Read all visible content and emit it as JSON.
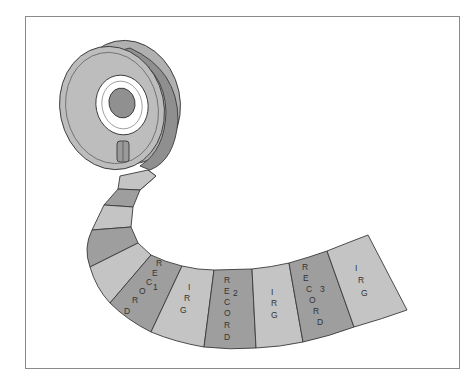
{
  "figure": {
    "type": "magnetic-tape-diagram",
    "colors": {
      "record": "#9e9e9e",
      "irg": "#c4c4c4",
      "outline": "#3a3a3a",
      "reel_face": "#bdbdbd",
      "reel_side": "#8f8f8f",
      "hub": "#909090",
      "hub_ring": "#ffffff",
      "frame": "#8a8a8a"
    },
    "segments": [
      {
        "kind": "record",
        "label": "RECORD",
        "number": "1"
      },
      {
        "kind": "irg",
        "label": "IRG"
      },
      {
        "kind": "record",
        "label": "RECORD",
        "number": "2"
      },
      {
        "kind": "irg",
        "label": "IRG"
      },
      {
        "kind": "record",
        "label": "RECORD",
        "number": "3"
      },
      {
        "kind": "irg",
        "label": "IRG"
      }
    ],
    "labels": {
      "r1": [
        "R",
        "E",
        "C",
        "O",
        "R",
        "D"
      ],
      "r1_num": "1",
      "irg1": [
        "I",
        "R",
        "G"
      ],
      "r2": [
        "R",
        "E",
        "C",
        "O",
        "R",
        "D"
      ],
      "r2_num": "2",
      "irg2": [
        "I",
        "R",
        "G"
      ],
      "r3": [
        "R",
        "E",
        "C",
        "O",
        "R",
        "D"
      ],
      "r3_num": "3",
      "irg3": [
        "I",
        "R",
        "G"
      ]
    }
  }
}
